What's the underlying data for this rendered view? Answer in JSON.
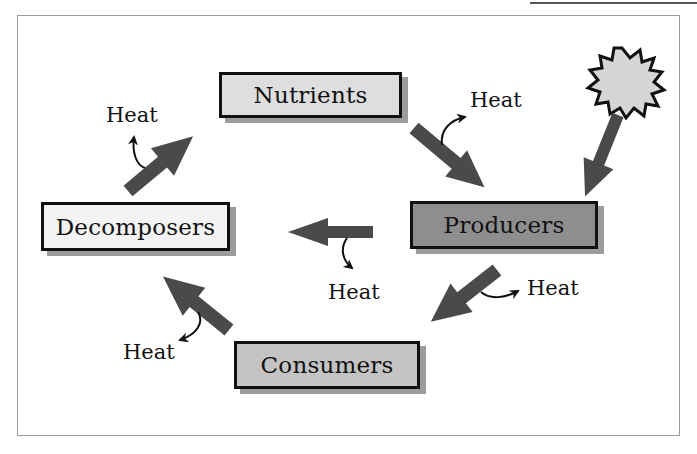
{
  "diagram": {
    "title": "",
    "colors": {
      "arrow": "#4a4a4a",
      "nutrients_fill": "#dedede",
      "producers_fill": "#8e8e8e",
      "decomposers_fill": "#f3f3f3",
      "consumers_fill": "#c4c4c4",
      "sun_fill": "#d6d6d6",
      "border": "#111111",
      "shadow": "#9c9c9c"
    },
    "nodes": [
      {
        "id": "nutrients",
        "label": "Nutrients"
      },
      {
        "id": "producers",
        "label": "Producers"
      },
      {
        "id": "consumers",
        "label": "Consumers"
      },
      {
        "id": "decomposers",
        "label": "Decomposers"
      }
    ],
    "sun": {
      "icon": "sun-starburst-icon"
    },
    "heat_labels": [
      {
        "id": "heat-nutrients-producers",
        "label": "Heat"
      },
      {
        "id": "heat-producers-decomposers",
        "label": "Heat"
      },
      {
        "id": "heat-producers-consumers",
        "label": "Heat"
      },
      {
        "id": "heat-consumers-decomposers",
        "label": "Heat"
      },
      {
        "id": "heat-decomposers-nutrients",
        "label": "Heat"
      }
    ],
    "edges": [
      {
        "from": "sun",
        "to": "producers"
      },
      {
        "from": "nutrients",
        "to": "producers",
        "heat": true
      },
      {
        "from": "producers",
        "to": "decomposers",
        "heat": true
      },
      {
        "from": "producers",
        "to": "consumers",
        "heat": true
      },
      {
        "from": "consumers",
        "to": "decomposers",
        "heat": true
      },
      {
        "from": "decomposers",
        "to": "nutrients",
        "heat": true
      }
    ]
  }
}
